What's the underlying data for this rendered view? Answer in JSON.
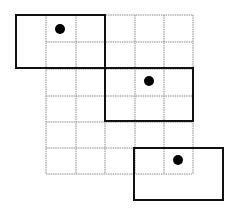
{
  "diagram": {
    "width": 238,
    "height": 215,
    "background": "#ffffff",
    "grid": {
      "columns": 5,
      "rows": 6,
      "x_lines": [
        46,
        76,
        105,
        135,
        164,
        193
      ],
      "y_lines": [
        15,
        42,
        69,
        96,
        122,
        148,
        174
      ],
      "color": "#8a8a8a"
    },
    "rectangles": [
      {
        "name": "window-1",
        "x": 16,
        "y": 15,
        "w": 89,
        "h": 53,
        "dot": {
          "cx": 60,
          "cy": 29,
          "r": 5
        }
      },
      {
        "name": "window-2",
        "x": 105,
        "y": 68,
        "w": 88,
        "h": 53,
        "dot": {
          "cx": 149,
          "cy": 81,
          "r": 5
        }
      },
      {
        "name": "window-3",
        "x": 134,
        "y": 148,
        "w": 89,
        "h": 52,
        "dot": {
          "cx": 178,
          "cy": 160,
          "r": 5
        }
      }
    ],
    "stroke_color": "#111111",
    "dot_color": "#000000"
  }
}
